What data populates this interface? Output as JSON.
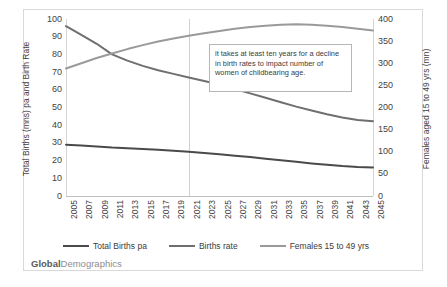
{
  "brand": {
    "part1": "Global",
    "part2": "Demographics"
  },
  "annotation": {
    "text": "it takes at least ten years for a decline in birth rates to impact number of women of childbearing age."
  },
  "legend": [
    {
      "label": "Total Births pa",
      "color": "#4a4a4a"
    },
    {
      "label": "Births rate",
      "color": "#6f6f6f"
    },
    {
      "label": "Females 15 to 49 yrs",
      "color": "#9a9a9a"
    }
  ],
  "chart_data": {
    "type": "line",
    "title": "",
    "xlabel": "",
    "ylabel": "Total Births (mns) pa and Birth Rate",
    "y2label": "Females aged 15 to 49 yrs (mn)",
    "ylim": [
      0,
      100
    ],
    "y2lim": [
      0,
      400
    ],
    "yticks": [
      0,
      10,
      20,
      30,
      40,
      50,
      60,
      70,
      80,
      90,
      100
    ],
    "y2ticks": [
      0,
      50,
      100,
      150,
      200,
      250,
      300,
      350,
      400
    ],
    "grid": false,
    "vertical_gridline_at": "2021",
    "legend_position": "bottom",
    "categories": [
      "2005",
      "2007",
      "2009",
      "2011",
      "2013",
      "2015",
      "2017",
      "2019",
      "2021",
      "2023",
      "2025",
      "2027",
      "2029",
      "2031",
      "2033",
      "2035",
      "2037",
      "2039",
      "2041",
      "2043",
      "2045"
    ],
    "series": [
      {
        "name": "Total Births pa",
        "axis": "left",
        "color": "#4a4a4a",
        "values": [
          29.0,
          28.5,
          28.0,
          27.4,
          27.0,
          26.6,
          26.1,
          25.6,
          25.0,
          24.3,
          23.6,
          22.8,
          22.0,
          21.1,
          20.2,
          19.3,
          18.4,
          17.6,
          16.9,
          16.4,
          16.1
        ]
      },
      {
        "name": "Births rate",
        "axis": "left",
        "color": "#6f6f6f",
        "values": [
          96.0,
          91.0,
          86.0,
          80.0,
          76.5,
          73.5,
          71.0,
          69.0,
          67.0,
          65.0,
          63.0,
          60.5,
          58.0,
          55.5,
          53.0,
          50.5,
          48.3,
          46.2,
          44.4,
          43.0,
          42.3
        ]
      },
      {
        "name": "Females 15 to 49 yrs",
        "axis": "right",
        "color": "#9a9a9a",
        "values": [
          288,
          300,
          312,
          322,
          332,
          341,
          349,
          356,
          362,
          368,
          373,
          378,
          382,
          385,
          387,
          388,
          387,
          385,
          382,
          378,
          374
        ]
      }
    ]
  }
}
